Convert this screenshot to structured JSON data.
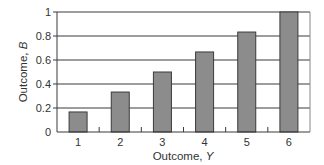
{
  "chart_data": {
    "type": "bar",
    "title": "",
    "xlabel": "Outcome, ",
    "xlabel_var": "Y",
    "ylabel": "Outcome, ",
    "ylabel_var": "B",
    "categories": [
      "1",
      "2",
      "3",
      "4",
      "5",
      "6"
    ],
    "values": [
      0.167,
      0.333,
      0.5,
      0.667,
      0.833,
      1.0
    ],
    "ylim": [
      0,
      1
    ],
    "yticks": [
      0,
      0.2,
      0.4,
      0.6,
      0.8,
      1
    ],
    "ytick_labels": [
      "0",
      "0.2",
      "0.4",
      "0.6",
      "0.8",
      "1"
    ],
    "grid": "horizontal",
    "legend": "none",
    "colors": {
      "bar_fill": "#8c8c8c",
      "bar_stroke": "#3a3a3a",
      "grid": "#3a3a3a",
      "axis": "#3a3a3a",
      "text": "#333333"
    }
  }
}
